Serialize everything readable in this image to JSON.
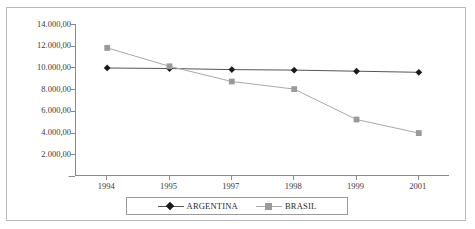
{
  "chart_data": {
    "type": "line",
    "title": "",
    "xlabel": "",
    "ylabel": "",
    "categories": [
      "1994",
      "1995",
      "1997",
      "1998",
      "1999",
      "2001"
    ],
    "ylim": [
      0,
      14000
    ],
    "ytick_labels": [
      "14.000,00",
      "12.000,00",
      "10.000,00",
      "8.000,00",
      "6.000,00",
      "4.000,00",
      "2.000,00",
      "-"
    ],
    "ytick_values": [
      14000,
      12000,
      10000,
      8000,
      6000,
      4000,
      2000,
      0
    ],
    "grid": false,
    "legend_position": "bottom",
    "series": [
      {
        "name": "ARGENTINA",
        "marker": "diamond",
        "color": "#1a1a1a",
        "line_color": "#555555",
        "values": [
          9950,
          9900,
          9800,
          9750,
          9650,
          9550
        ]
      },
      {
        "name": "BRASIL",
        "marker": "square",
        "color": "#9a9a9a",
        "line_color": "#a8a8a8",
        "values": [
          11800,
          10100,
          8700,
          8000,
          5200,
          3950
        ]
      }
    ]
  },
  "axis": {
    "tick_color": "#8a8a8a",
    "label_color": "#3a3a3a"
  },
  "frame": {
    "border_color": "#b9b9b9"
  },
  "title_remnant": {
    "text": ""
  }
}
